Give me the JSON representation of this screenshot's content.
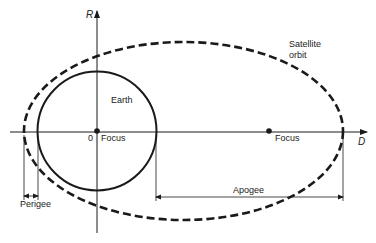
{
  "diagram": {
    "type": "satellite-orbit-geometry",
    "colors": {
      "line": "#1a1a1a",
      "text": "#222222",
      "background": "#ffffff"
    },
    "axes": {
      "vertical_label": "R",
      "horizontal_label": "D",
      "origin_label": "0"
    },
    "bodies": {
      "earth_label": "Earth",
      "orbit_label_line1": "Satellite",
      "orbit_label_line2": "orbit"
    },
    "foci": {
      "primary_label": "Focus",
      "secondary_label": "Focus"
    },
    "dimensions": {
      "perigee_label": "Perigee",
      "apogee_label": "Apogee"
    }
  }
}
